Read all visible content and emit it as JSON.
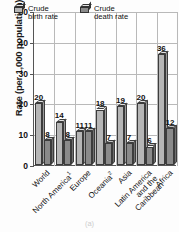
{
  "axes": {
    "ylabel": "Rate (per 1,000 population)",
    "yticks": [
      "0",
      "10",
      "20",
      "30",
      "40",
      "50"
    ]
  },
  "legend": {
    "items": [
      {
        "label_line1": "Crude",
        "label_line2": "birth rate",
        "icon": "cube-icon",
        "color": "#b6b6b6"
      },
      {
        "label_line1": "Crude",
        "label_line2": "death rate",
        "icon": "cube-icon",
        "color": "#8a8a8a"
      }
    ]
  },
  "caption": "(a)",
  "chart_data": {
    "type": "bar",
    "title": "",
    "xlabel": "",
    "ylabel": "Rate (per 1,000 population)",
    "ylim": [
      0,
      50
    ],
    "ytick_step": 10,
    "grid": true,
    "legend_position": "top-inside",
    "categories": [
      "World",
      "North America¹",
      "Europe",
      "Oceania²",
      "Asia",
      "Latin America and the Caribbean",
      "Africa"
    ],
    "category_lines": [
      [
        "World"
      ],
      [
        "North America",
        "1"
      ],
      [
        "Europe"
      ],
      [
        "Oceania",
        "2"
      ],
      [
        "Asia"
      ],
      [
        "Latin America",
        "and the",
        "Caribbean"
      ],
      [
        "Africa"
      ]
    ],
    "series": [
      {
        "name": "Crude birth rate",
        "values": [
          20,
          14,
          11,
          18,
          19,
          20,
          36
        ]
      },
      {
        "name": "Crude death rate",
        "values": [
          8,
          8,
          11,
          7,
          7,
          6,
          12
        ]
      }
    ]
  }
}
